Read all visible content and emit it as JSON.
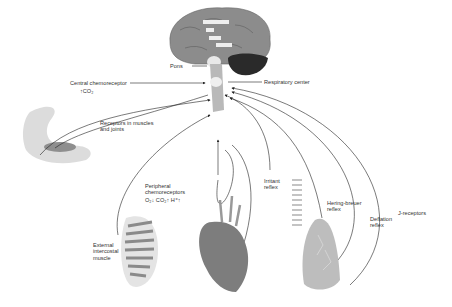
{
  "diagram": {
    "brain_labels": [
      "Pons",
      "Respiratory center"
    ],
    "central_chemoreceptor": {
      "label": "Central chemoreceptor",
      "stimulus": "↑CO₂"
    },
    "receptors_muscles": "Receptors in muscles\nand joints",
    "peripheral": {
      "label": "Peripheral\nchemoreceptors",
      "stimuli": "O₂↓  CO₂↑  H⁺↑"
    },
    "external_intercostal": "External\nintercostal\nmuscle",
    "irritant": "Irritant\nreflex",
    "hering_breuer": "Hering-breuer\nreflex",
    "deflation": "Deflation\nreflex",
    "j_receptors": "J-receptors",
    "colors": {
      "line": "#222222",
      "organ": "#8a8a8a",
      "dark": "#2a2a2a",
      "light": "#d9d9d9"
    }
  }
}
